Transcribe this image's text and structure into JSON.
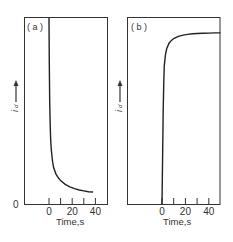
{
  "chart_data": [
    {
      "type": "line",
      "panel_label": "( a )",
      "xlabel": "Time,s",
      "ylabel": "i_d",
      "y_arrow": "up-arrow",
      "x_ticks": [
        0,
        10,
        20,
        30,
        40
      ],
      "x_tick_labels": [
        "0",
        "20",
        "40"
      ],
      "y_tick_labels": [
        "0"
      ],
      "xlim": [
        -22,
        50
      ],
      "ylim": [
        0,
        1
      ],
      "series": [
        {
          "name": "current decay",
          "x": [
            0,
            0.3,
            0.6,
            1,
            1.5,
            2,
            3,
            4,
            6,
            8,
            10,
            14,
            18,
            22,
            26,
            30,
            34,
            38
          ],
          "y": [
            1.0,
            0.75,
            0.55,
            0.42,
            0.34,
            0.29,
            0.23,
            0.195,
            0.16,
            0.14,
            0.125,
            0.105,
            0.092,
            0.082,
            0.075,
            0.07,
            0.066,
            0.064
          ]
        }
      ]
    },
    {
      "type": "line",
      "panel_label": "( b )",
      "xlabel": "Time,s",
      "ylabel": "i_d",
      "y_arrow": "up-arrow",
      "x_ticks": [
        0,
        10,
        20,
        30,
        40
      ],
      "x_tick_labels": [
        "0",
        "20",
        "40"
      ],
      "y_tick_labels": [],
      "xlim": [
        -30,
        50
      ],
      "ylim": [
        0,
        1
      ],
      "series": [
        {
          "name": "current rise",
          "x": [
            0,
            0.5,
            1,
            1.5,
            2,
            3,
            4,
            6,
            8,
            10,
            14,
            18,
            22,
            26,
            30,
            35,
            40,
            45,
            50
          ],
          "y": [
            0.0,
            0.25,
            0.5,
            0.66,
            0.74,
            0.8,
            0.83,
            0.86,
            0.875,
            0.885,
            0.897,
            0.903,
            0.907,
            0.91,
            0.912,
            0.913,
            0.914,
            0.915,
            0.915
          ]
        }
      ]
    }
  ]
}
